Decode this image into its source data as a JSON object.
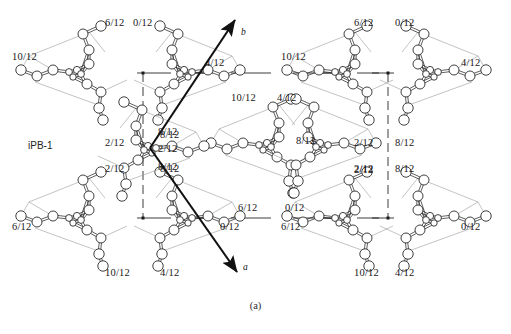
{
  "figure": {
    "sample_label": "iPB-1",
    "caption": "(a)",
    "axes": [
      {
        "name": "b-axis-arrow",
        "label": "b",
        "x1": 150,
        "y1": 148,
        "x2": 235,
        "y2": 20,
        "label_x": 241,
        "label_y": 27
      },
      {
        "name": "a-axis-arrow",
        "label": "a",
        "x1": 150,
        "y1": 148,
        "x2": 237,
        "y2": 272,
        "label_x": 243,
        "label_y": 262
      }
    ],
    "unit_cell": {
      "left": 143,
      "right": 388,
      "top": 73,
      "bottom": 218,
      "corner_marker_color": "#1a1a1a"
    },
    "molecules": [
      {
        "id": "m1",
        "cx": 75,
        "cy": 72,
        "flip": false,
        "labels": [
          {
            "text": "6/12",
            "x": 105,
            "y": 18
          },
          {
            "text": "10/12",
            "x": 12,
            "y": 52
          },
          {
            "text": "2/12",
            "x": 105,
            "y": 138
          }
        ]
      },
      {
        "id": "m2",
        "cx": 186,
        "cy": 72,
        "flip": true,
        "labels": [
          {
            "text": "0/12",
            "x": 133,
            "y": 18
          },
          {
            "text": "4/12",
            "x": 205,
            "y": 58
          },
          {
            "text": "8/12",
            "x": 160,
            "y": 130
          }
        ]
      },
      {
        "id": "m3",
        "cx": 341,
        "cy": 72,
        "flip": false,
        "labels": [
          {
            "text": "6/12",
            "x": 354,
            "y": 18
          },
          {
            "text": "10/12",
            "x": 281,
            "y": 52
          },
          {
            "text": "2/12",
            "x": 354,
            "y": 138
          }
        ]
      },
      {
        "id": "m4",
        "cx": 432,
        "cy": 72,
        "flip": true,
        "labels": [
          {
            "text": "0/12",
            "x": 395,
            "y": 18
          },
          {
            "text": "4/12",
            "x": 461,
            "y": 58
          },
          {
            "text": "8/12",
            "x": 395,
            "y": 138
          }
        ]
      },
      {
        "id": "m5",
        "cx": 265,
        "cy": 145,
        "flip": false,
        "labels": [
          {
            "text": "10/12",
            "x": 231,
            "y": 93
          },
          {
            "text": "8/12",
            "x": 296,
            "y": 136
          },
          {
            "text": "6/12",
            "x": 238,
            "y": 203
          }
        ]
      },
      {
        "id": "m6",
        "cx": 322,
        "cy": 145,
        "flip": true,
        "labels": [
          {
            "text": "4/12",
            "x": 277,
            "y": 93
          },
          {
            "text": "2/12",
            "x": 354,
            "y": 165
          },
          {
            "text": "0/12",
            "x": 285,
            "y": 203
          }
        ]
      },
      {
        "id": "m7",
        "cx": 75,
        "cy": 218,
        "flip": false,
        "labels": [
          {
            "text": "2/12",
            "x": 105,
            "y": 164
          },
          {
            "text": "6/12",
            "x": 12,
            "y": 222
          },
          {
            "text": "10/12",
            "x": 105,
            "y": 268
          }
        ]
      },
      {
        "id": "m8",
        "cx": 186,
        "cy": 218,
        "flip": true,
        "labels": [
          {
            "text": "8/12",
            "x": 160,
            "y": 164
          },
          {
            "text": "0/12",
            "x": 220,
            "y": 222
          },
          {
            "text": "4/12",
            "x": 160,
            "y": 268
          }
        ]
      },
      {
        "id": "m9",
        "cx": 341,
        "cy": 218,
        "flip": false,
        "labels": [
          {
            "text": "2/12",
            "x": 354,
            "y": 164
          },
          {
            "text": "6/12",
            "x": 281,
            "y": 222
          },
          {
            "text": "10/12",
            "x": 354,
            "y": 268
          }
        ]
      },
      {
        "id": "m10",
        "cx": 432,
        "cy": 218,
        "flip": true,
        "labels": [
          {
            "text": "8/12",
            "x": 395,
            "y": 164
          },
          {
            "text": "0/12",
            "x": 461,
            "y": 222
          },
          {
            "text": "4/12",
            "x": 395,
            "y": 268
          }
        ]
      },
      {
        "id": "m11",
        "cx": 150,
        "cy": 148,
        "flip": true,
        "center": true,
        "labels": [
          {
            "text": "8/12",
            "x": 158,
            "y": 127
          },
          {
            "text": "2/12",
            "x": 158,
            "y": 144
          },
          {
            "text": "8/12",
            "x": 158,
            "y": 162
          }
        ]
      }
    ],
    "edge_labels": [
      {
        "text": "0/12",
        "x": 0,
        "y": 114,
        "hidden": true
      }
    ]
  },
  "chart_data": {
    "type": "scatter",
    "subtitle": "(a)",
    "xlabel": "a",
    "ylabel": "b",
    "legend": [],
    "grid": false,
    "annotations": [
      "6/12",
      "0/12",
      "10/12",
      "4/12",
      "2/12",
      "8/12",
      "6/12",
      "0/12",
      "10/12",
      "4/12",
      "2/12",
      "8/12",
      "10/12",
      "4/12",
      "8/12",
      "2/12",
      "6/12",
      "0/12",
      "2/12",
      "8/12",
      "6/12",
      "0/12",
      "10/12",
      "4/12",
      "2/12",
      "8/12",
      "6/12",
      "0/12",
      "10/12",
      "4/12",
      "8/12",
      "2/12",
      "8/12"
    ],
    "note": "Helical chain molecules projected down the c-axis; numbers are fractional c-axis heights in twelfths."
  }
}
